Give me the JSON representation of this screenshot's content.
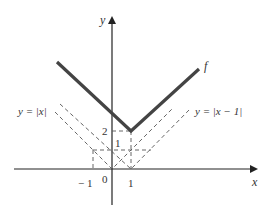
{
  "diagram": {
    "title": "",
    "axes": {
      "x_label": "x",
      "y_label": "y",
      "origin_label": "0",
      "x_ticks": [
        {
          "value": -1,
          "label": "− 1"
        },
        {
          "value": 1,
          "label": "1"
        }
      ],
      "y_ticks": [
        {
          "value": 1,
          "label": "1"
        },
        {
          "value": 2,
          "label": "2"
        }
      ]
    },
    "curves": [
      {
        "name": "f",
        "label": "f",
        "style": "solid-thick",
        "expression": "|x| + |x - 1|"
      },
      {
        "name": "abs-x",
        "label": "y = |x|",
        "style": "dashed"
      },
      {
        "name": "abs-x-minus-1",
        "label": "y = |x − 1|",
        "style": "dashed"
      }
    ],
    "colors": {
      "axis": "#222222",
      "f_curve": "#444444",
      "dashed": "#555555",
      "text": "#333333"
    }
  }
}
